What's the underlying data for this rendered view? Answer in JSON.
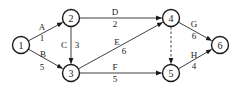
{
  "diagram": {
    "type": "activity-on-arrow network",
    "nodes": [
      {
        "id": "1",
        "label": "1",
        "x": 21,
        "y": 45
      },
      {
        "id": "2",
        "label": "2",
        "x": 71,
        "y": 18
      },
      {
        "id": "3",
        "label": "3",
        "x": 71,
        "y": 73
      },
      {
        "id": "4",
        "label": "4",
        "x": 171,
        "y": 18
      },
      {
        "id": "5",
        "label": "5",
        "x": 171,
        "y": 73
      },
      {
        "id": "6",
        "label": "6",
        "x": 220,
        "y": 45
      }
    ],
    "edges": [
      {
        "from": "1",
        "to": "2",
        "activity": "A",
        "duration": "1",
        "dashed": false
      },
      {
        "from": "1",
        "to": "3",
        "activity": "B",
        "duration": "5",
        "dashed": false
      },
      {
        "from": "2",
        "to": "3",
        "activity": "C",
        "duration": "3",
        "dashed": false
      },
      {
        "from": "2",
        "to": "4",
        "activity": "D",
        "duration": "2",
        "dashed": false
      },
      {
        "from": "3",
        "to": "4",
        "activity": "E",
        "duration": "6",
        "dashed": false
      },
      {
        "from": "3",
        "to": "5",
        "activity": "F",
        "duration": "5",
        "dashed": false
      },
      {
        "from": "4",
        "to": "5",
        "activity": "",
        "duration": "",
        "dashed": true
      },
      {
        "from": "4",
        "to": "6",
        "activity": "G",
        "duration": "6",
        "dashed": false
      },
      {
        "from": "5",
        "to": "6",
        "activity": "H",
        "duration": "4",
        "dashed": false
      }
    ]
  }
}
